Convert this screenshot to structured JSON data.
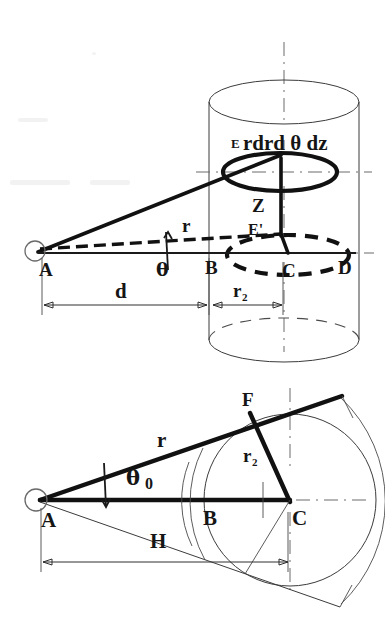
{
  "figure": {
    "background_color": "#ffffff",
    "ink_color": "#151515",
    "panels": [
      {
        "id": "upper",
        "name": "perspective-cylinder-panel",
        "description": "Perspective view of a cylinder with elemental volume element E and projection E' on the base plane"
      },
      {
        "id": "lower",
        "name": "plan-section-panel",
        "description": "Plan section showing tangent cone from point A to circle centred at C, with tangent point F"
      }
    ]
  },
  "upper_panel": {
    "labels": {
      "element": "rdrd θ dz",
      "point_e": "E",
      "point_e_prime": "E'",
      "height_z": "Z",
      "point_a": "A",
      "point_b": "B",
      "point_c": "C",
      "point_d": "D",
      "radius_r": "r",
      "angle_theta": "θ",
      "dim_d": "d",
      "dim_r2": "r",
      "dim_r2_sub": "2"
    }
  },
  "lower_panel": {
    "labels": {
      "point_a": "A",
      "point_b": "B",
      "point_c": "C",
      "point_f": "F",
      "radius_r": "r",
      "radius_r2": "r",
      "radius_r2_sub": "2",
      "angle_theta": "θ",
      "angle_theta_sub": "0",
      "dim_h": "H"
    }
  },
  "geometry": {
    "upper": {
      "vertex_a": [
        36,
        251
      ],
      "point_b": [
        207,
        251
      ],
      "point_c": [
        283,
        252
      ],
      "point_d": [
        352,
        252
      ],
      "point_e": [
        281,
        155
      ],
      "point_e_prime": [
        281,
        234
      ],
      "cylinder_left_x": 209,
      "cylinder_right_x": 360,
      "cylinder_top_y": 80,
      "cylinder_bottom_y": 340,
      "cylinder_rx": 75,
      "cylinder_ry": 22,
      "element_ellipse": {
        "cx": 280,
        "cy": 172,
        "rx": 57,
        "ry": 19
      },
      "base_ellipse": {
        "cx": 288,
        "cy": 255,
        "rx": 61,
        "ry": 20
      },
      "dimension_y": 305,
      "dim_d_from": 42,
      "dim_d_to": 207,
      "dim_r2_from": 212,
      "dim_r2_to": 282
    },
    "lower": {
      "vertex_a": [
        37,
        500
      ],
      "point_b": [
        207,
        500
      ],
      "point_c": [
        290,
        500
      ],
      "point_f": [
        250,
        413
      ],
      "circle": {
        "cx": 290,
        "cy": 500,
        "r": 86
      },
      "dimension_y": 562,
      "dim_h_from": 41,
      "dim_h_to": 288
    }
  }
}
